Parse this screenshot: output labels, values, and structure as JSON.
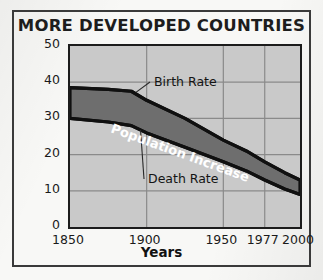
{
  "chart_data": {
    "type": "area",
    "title": "MORE DEVELOPED COUNTRIES",
    "xlabel": "Years",
    "ylabel": "Per 1,000 Population",
    "xlim": [
      1850,
      2000
    ],
    "ylim": [
      0,
      50
    ],
    "xticks": [
      1850,
      1900,
      1950,
      1977,
      2000
    ],
    "xtick_labels": [
      "1850",
      "1900",
      "1950",
      "1977",
      "2000"
    ],
    "yticks": [
      0,
      10,
      20,
      30,
      40,
      50
    ],
    "ytick_labels": [
      "0",
      "10",
      "20",
      "30",
      "40",
      "50"
    ],
    "grid": true,
    "legend": "inline-annotations",
    "annotations": [
      {
        "text": "Birth Rate",
        "color": "#1a1a1a"
      },
      {
        "text": "Death Rate",
        "color": "#1a1a1a"
      },
      {
        "text": "Population Increase",
        "color": "#ffffff"
      }
    ],
    "series": [
      {
        "name": "Birth Rate",
        "x": [
          1850,
          1875,
          1890,
          1900,
          1925,
          1950,
          1965,
          1977,
          1990,
          2000
        ],
        "values": [
          38.5,
          38.0,
          37.5,
          35.0,
          30.0,
          24.0,
          21.0,
          18.0,
          15.0,
          13.0
        ]
      },
      {
        "name": "Death Rate",
        "x": [
          1850,
          1875,
          1890,
          1900,
          1925,
          1950,
          1965,
          1977,
          1990,
          2000
        ],
        "values": [
          30.0,
          29.0,
          28.0,
          26.0,
          22.0,
          18.0,
          15.5,
          13.0,
          10.5,
          9.0
        ]
      }
    ],
    "band": {
      "name": "Population Increase",
      "between": [
        "Death Rate",
        "Birth Rate"
      ],
      "fill": "#6e6e6e"
    },
    "colors": {
      "plot_background": "#c9c9c9",
      "band_fill": "#6e6e6e",
      "line": "#101010",
      "grid": "#8a8a8a",
      "frame": "#3a3a3a",
      "text": "#1a1a1a",
      "band_label_text": "#ffffff"
    }
  }
}
